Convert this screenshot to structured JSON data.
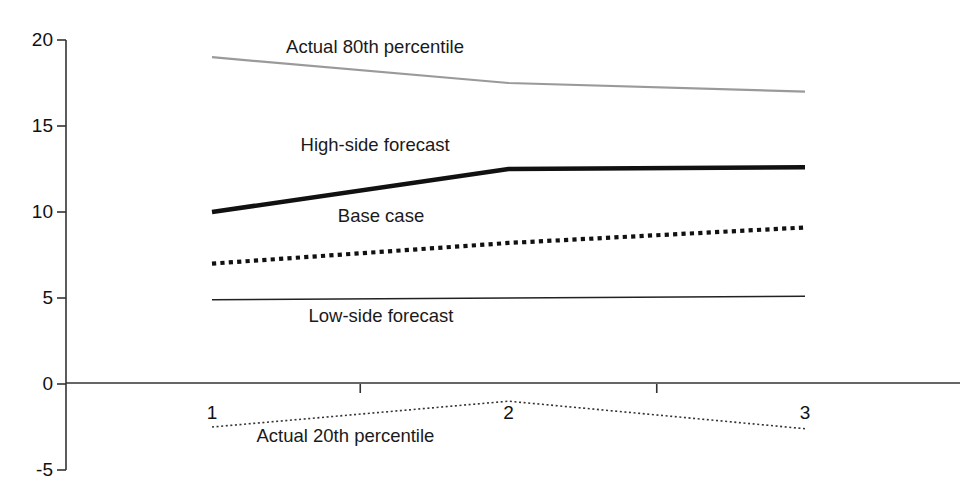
{
  "chart_data": {
    "type": "line",
    "title": "",
    "subtitle": "",
    "xlabel": "",
    "ylabel": "",
    "x": [
      1,
      2,
      3
    ],
    "categories": [
      "1",
      "2",
      "3"
    ],
    "ylim": [
      -5,
      20
    ],
    "yticks": [
      20,
      15,
      10,
      5,
      0,
      -5
    ],
    "ytick_labels": [
      "20",
      "15",
      "10",
      "5",
      "0",
      "-5"
    ],
    "xtick_labels": [
      "1",
      "2",
      "3"
    ],
    "grid": false,
    "legend_position": "inline-annotations",
    "series": [
      {
        "name": "Actual 80th percentile",
        "values": [
          19.0,
          17.5,
          17.0
        ],
        "style": "solid",
        "color": "#9a9a9a",
        "width": 2.2,
        "label_x": 1.55,
        "label_y": 19.6
      },
      {
        "name": "High-side forecast",
        "values": [
          10.0,
          12.5,
          12.6
        ],
        "style": "solid",
        "color": "#111111",
        "width": 4.5,
        "label_x": 1.55,
        "label_y": 13.9
      },
      {
        "name": "Base case",
        "values": [
          7.0,
          8.2,
          9.1
        ],
        "style": "dotted-heavy",
        "color": "#111111",
        "width": 4.2,
        "label_x": 1.57,
        "label_y": 9.75
      },
      {
        "name": "Low-side forecast",
        "values": [
          4.9,
          5.0,
          5.1
        ],
        "style": "solid",
        "color": "#222222",
        "width": 1.4,
        "label_x": 1.57,
        "label_y": 3.95
      },
      {
        "name": "Actual 20th percentile",
        "values": [
          -2.5,
          -1.0,
          -2.6
        ],
        "style": "dotted-fine",
        "color": "#333333",
        "width": 1.6,
        "label_x": 1.45,
        "label_y": -3.05
      }
    ],
    "axes": {
      "y_axis_color": "#333333",
      "x_axis_color": "#333333",
      "y_axis_x": 66,
      "x_axis_y_value": 0,
      "plot_left": 212,
      "plot_right": 805,
      "plot_top": 40,
      "plot_bottom": 470,
      "x_minor_ticks": [
        1.5,
        2.5
      ]
    }
  }
}
